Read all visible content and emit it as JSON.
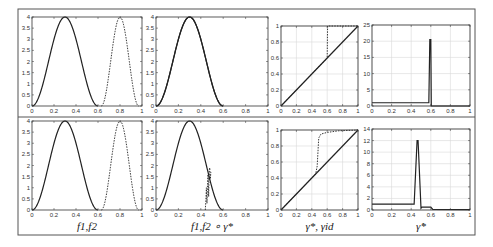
{
  "figure": {
    "frame_color": "#555555",
    "line_color": "#222222",
    "grid_color": "#d8d8d8",
    "row_labels": [
      "f1,f2",
      "f1,f2 ∘ γ*",
      "γ*, γid",
      "γ̇*"
    ]
  },
  "chart_data": [
    {
      "id": "r1c1",
      "type": "line",
      "row": 1,
      "col": 1,
      "xlim": [
        0,
        1
      ],
      "ylim": [
        0,
        4
      ],
      "grid": false,
      "xticks": [
        "0",
        "0.2",
        "0.4",
        "0.6",
        "0.8",
        "1"
      ],
      "yticks": [
        "0",
        "0.5",
        "1",
        "1.5",
        "2",
        "2.5",
        "3",
        "3.5",
        "4"
      ],
      "series": [
        {
          "name": "f1",
          "style": "solid",
          "kind": "bump",
          "center": 0.3,
          "halfwidth": 0.3,
          "peak": 4
        },
        {
          "name": "f2",
          "style": "dashed",
          "kind": "bump",
          "center": 0.8,
          "halfwidth": 0.17,
          "peak": 4
        }
      ]
    },
    {
      "id": "r1c2",
      "type": "line",
      "row": 1,
      "col": 2,
      "xlim": [
        0,
        1
      ],
      "ylim": [
        0,
        4
      ],
      "grid": false,
      "xticks": [
        "0",
        "0.2",
        "0.4",
        "0.6",
        "0.8",
        "1"
      ],
      "yticks": [
        "0",
        "0.5",
        "1",
        "1.5",
        "2",
        "2.5",
        "3",
        "3.5",
        "4"
      ],
      "series": [
        {
          "name": "f1",
          "style": "solid",
          "kind": "bump",
          "center": 0.3,
          "halfwidth": 0.3,
          "peak": 4
        },
        {
          "name": "f2∘γ*",
          "style": "solid",
          "kind": "bump",
          "center": 0.3,
          "halfwidth": 0.3,
          "peak": 4
        }
      ]
    },
    {
      "id": "r1c3",
      "type": "line",
      "row": 1,
      "col": 3,
      "xlim": [
        0,
        1
      ],
      "ylim": [
        0,
        1
      ],
      "grid": true,
      "xticks": [
        "0",
        "0.2",
        "0.4",
        "0.6",
        "0.8",
        "1"
      ],
      "yticks": [
        "0",
        "0.2",
        "0.4",
        "0.6",
        "0.8",
        "1"
      ],
      "series": [
        {
          "name": "γid",
          "style": "solid",
          "points": [
            [
              0,
              0
            ],
            [
              1,
              1
            ]
          ]
        },
        {
          "name": "γ*",
          "style": "dashed",
          "points": [
            [
              0,
              0
            ],
            [
              0.6,
              0.6
            ],
            [
              0.605,
              1.0
            ],
            [
              1,
              1
            ]
          ]
        }
      ]
    },
    {
      "id": "r1c4",
      "type": "line",
      "row": 1,
      "col": 4,
      "xlim": [
        0,
        1
      ],
      "ylim": [
        0,
        25
      ],
      "grid": true,
      "xticks": [
        "0",
        "0.2",
        "0.4",
        "0.6",
        "0.8",
        "1"
      ],
      "yticks": [
        "0",
        "5",
        "10",
        "15",
        "20",
        "25"
      ],
      "series": [
        {
          "name": "γ̇*",
          "style": "solid",
          "points": [
            [
              0,
              1
            ],
            [
              0.58,
              1
            ],
            [
              0.59,
              20.5
            ],
            [
              0.6,
              20.5
            ],
            [
              0.605,
              0
            ],
            [
              1,
              0
            ]
          ]
        }
      ]
    },
    {
      "id": "r2c1",
      "type": "line",
      "row": 2,
      "col": 1,
      "xlim": [
        0,
        1
      ],
      "ylim": [
        0,
        4
      ],
      "grid": false,
      "xticks": [
        "0",
        "0.2",
        "0.4",
        "0.6",
        "0.8",
        "1"
      ],
      "yticks": [
        "0",
        "0.5",
        "1",
        "1.5",
        "2",
        "2.5",
        "3",
        "3.5",
        "4"
      ],
      "xlabel": "f1,f2",
      "series": [
        {
          "name": "f1",
          "style": "solid",
          "kind": "bump",
          "center": 0.3,
          "halfwidth": 0.3,
          "peak": 4
        },
        {
          "name": "f2",
          "style": "dashed",
          "kind": "bump",
          "center": 0.8,
          "halfwidth": 0.17,
          "peak": 4
        }
      ]
    },
    {
      "id": "r2c2",
      "type": "line",
      "row": 2,
      "col": 2,
      "xlim": [
        0,
        1
      ],
      "ylim": [
        0,
        4
      ],
      "grid": false,
      "xticks": [
        "0",
        "0.2",
        "0.4",
        "0.6",
        "0.8",
        "1"
      ],
      "yticks": [
        "0",
        "0.5",
        "1",
        "1.5",
        "2",
        "2.5",
        "3",
        "3.5",
        "4"
      ],
      "xlabel": "f1,f2 ∘ γ*",
      "series": [
        {
          "name": "f1",
          "style": "solid",
          "kind": "bump",
          "center": 0.3,
          "halfwidth": 0.3,
          "peak": 4
        },
        {
          "name": "f2∘γ*",
          "style": "dashed",
          "points": [
            [
              0.44,
              0
            ],
            [
              0.445,
              0.4
            ],
            [
              0.45,
              1.0
            ],
            [
              0.455,
              0.3
            ],
            [
              0.46,
              1.2
            ],
            [
              0.465,
              1.6
            ],
            [
              0.47,
              0.6
            ],
            [
              0.475,
              1.8
            ],
            [
              0.48,
              1.9
            ],
            [
              0.485,
              1.4
            ],
            [
              0.49,
              1.7
            ]
          ]
        }
      ]
    },
    {
      "id": "r2c3",
      "type": "line",
      "row": 2,
      "col": 3,
      "xlim": [
        0,
        1
      ],
      "ylim": [
        0,
        1
      ],
      "grid": true,
      "xticks": [
        "0",
        "0.2",
        "0.4",
        "0.6",
        "0.8",
        "1"
      ],
      "yticks": [
        "0",
        "0.2",
        "0.4",
        "0.6",
        "0.8",
        "1"
      ],
      "xlabel": "γ*, γid",
      "series": [
        {
          "name": "γid",
          "style": "solid",
          "points": [
            [
              0,
              0
            ],
            [
              1,
              1
            ]
          ]
        },
        {
          "name": "γ*",
          "style": "dashed",
          "points": [
            [
              0,
              0
            ],
            [
              0.45,
              0.45
            ],
            [
              0.47,
              0.55
            ],
            [
              0.49,
              0.9
            ],
            [
              0.52,
              0.95
            ],
            [
              0.6,
              0.97
            ],
            [
              0.75,
              0.99
            ],
            [
              1,
              1
            ]
          ]
        }
      ]
    },
    {
      "id": "r2c4",
      "type": "line",
      "row": 2,
      "col": 4,
      "xlim": [
        0,
        1
      ],
      "ylim": [
        0,
        14
      ],
      "grid": true,
      "xticks": [
        "0",
        "0.2",
        "0.4",
        "0.6",
        "0.8",
        "1"
      ],
      "yticks": [
        "0",
        "2",
        "4",
        "6",
        "8",
        "10",
        "12",
        "14"
      ],
      "xlabel": "γ̇*",
      "series": [
        {
          "name": "γ̇*",
          "style": "solid",
          "points": [
            [
              0,
              1
            ],
            [
              0.43,
              1
            ],
            [
              0.46,
              12
            ],
            [
              0.47,
              12
            ],
            [
              0.5,
              0.3
            ],
            [
              0.51,
              0.5
            ],
            [
              0.6,
              0.5
            ],
            [
              0.62,
              0.1
            ],
            [
              1,
              0.05
            ]
          ]
        }
      ]
    }
  ],
  "layout": {
    "frame": {
      "x": 18,
      "y": 9,
      "w": 457,
      "h": 226
    },
    "divider_y": 117,
    "axes": {
      "r1c1": {
        "x": 32,
        "y": 17,
        "w": 110,
        "h": 89
      },
      "r1c2": {
        "x": 156,
        "y": 17,
        "w": 112,
        "h": 89
      },
      "r1c3": {
        "x": 281,
        "y": 26,
        "w": 77,
        "h": 80
      },
      "r1c4": {
        "x": 372,
        "y": 25,
        "w": 98,
        "h": 81
      },
      "r2c1": {
        "x": 32,
        "y": 121,
        "w": 110,
        "h": 89
      },
      "r2c2": {
        "x": 156,
        "y": 121,
        "w": 112,
        "h": 89
      },
      "r2c3": {
        "x": 281,
        "y": 130,
        "w": 77,
        "h": 80
      },
      "r2c4": {
        "x": 372,
        "y": 129,
        "w": 98,
        "h": 81
      }
    },
    "xlabel_y": 230
  }
}
